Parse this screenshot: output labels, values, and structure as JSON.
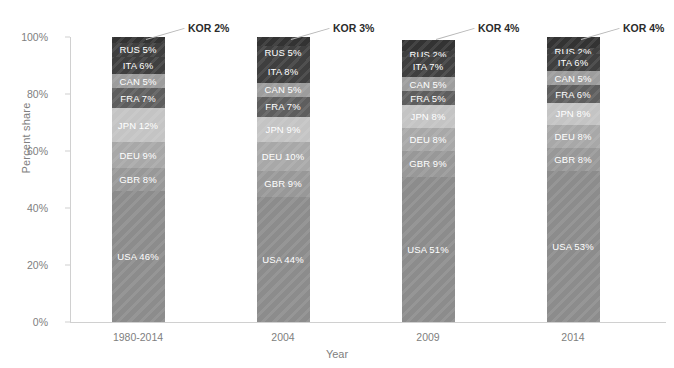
{
  "chart_data": {
    "type": "bar",
    "stacked": true,
    "stack_mode": "percent",
    "title": "",
    "subtitle": "",
    "xlabel": "Year",
    "ylabel": "Percent share",
    "ylim": [
      0,
      100
    ],
    "ytick_labels": [
      "0%",
      "20%",
      "40%",
      "60%",
      "80%",
      "100%"
    ],
    "ytick_values": [
      0,
      20,
      40,
      60,
      80,
      100
    ],
    "grid": false,
    "legend": "none",
    "annotations_position": "above-bar-right",
    "categories": [
      "1980-2014",
      "2004",
      "2009",
      "2014"
    ],
    "series": [
      {
        "name": "USA",
        "values": [
          46,
          44,
          51,
          53
        ],
        "labels": [
          "USA 46%",
          "USA 44%",
          "USA 51%",
          "USA 53%"
        ],
        "color": "#8c8c8c"
      },
      {
        "name": "GBR",
        "values": [
          8,
          9,
          9,
          8
        ],
        "labels": [
          "GBR 8%",
          "GBR 9%",
          "GBR 9%",
          "GBR 8%"
        ],
        "color": "#989898"
      },
      {
        "name": "DEU",
        "values": [
          9,
          10,
          8,
          8
        ],
        "labels": [
          "DEU 9%",
          "DEU 10%",
          "DEU 8%",
          "DEU 8%"
        ],
        "color": "#a8a8a8"
      },
      {
        "name": "JPN",
        "values": [
          12,
          9,
          8,
          8
        ],
        "labels": [
          "JPN 12%",
          "JPN 9%",
          "JPN 8%",
          "JPN 8%"
        ],
        "color": "#c4c4c4"
      },
      {
        "name": "FRA",
        "values": [
          7,
          7,
          5,
          6
        ],
        "labels": [
          "FRA 7%",
          "FRA 7%",
          "FRA 5%",
          "FRA 6%"
        ],
        "color": "#5e5e5e"
      },
      {
        "name": "CAN",
        "values": [
          5,
          5,
          5,
          5
        ],
        "labels": [
          "CAN 5%",
          "CAN 5%",
          "CAN 5%",
          "CAN 5%"
        ],
        "color": "#9d9d9d"
      },
      {
        "name": "ITA",
        "values": [
          6,
          8,
          7,
          6
        ],
        "labels": [
          "ITA 6%",
          "ITA 8%",
          "ITA 7%",
          "ITA 6%"
        ],
        "color": "#3f3f3f"
      },
      {
        "name": "RUS",
        "values": [
          5,
          5,
          2,
          2
        ],
        "labels": [
          "RUS 5%",
          "RUS 5%",
          "RUS 2%",
          "RUS 2%"
        ],
        "color": "#3f3f3f"
      },
      {
        "name": "KOR",
        "values": [
          2,
          3,
          4,
          4
        ],
        "labels": [
          "KOR 2%",
          "KOR 3%",
          "KOR 4%",
          "KOR 4%"
        ],
        "color": "#333333"
      }
    ],
    "callouts": [
      {
        "label": "KOR 2%"
      },
      {
        "label": "KOR 3%"
      },
      {
        "label": "KOR 4%"
      },
      {
        "label": "KOR 4%"
      }
    ]
  }
}
